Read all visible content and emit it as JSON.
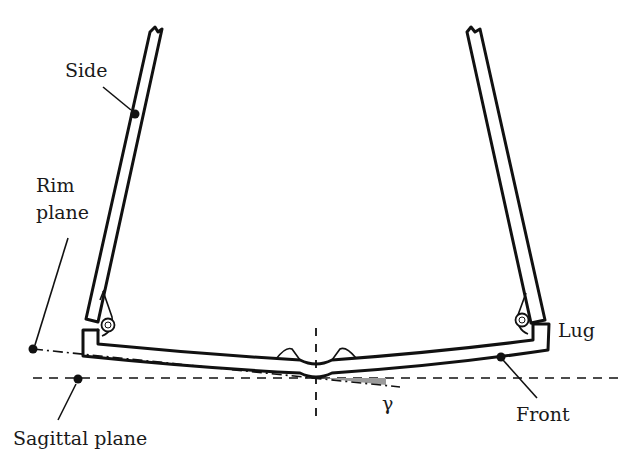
{
  "figure": {
    "labels": {
      "side": "Side",
      "rim_plane_line1": "Rim",
      "rim_plane_line2": "plane",
      "lug": "Lug",
      "front": "Front",
      "gamma": "γ",
      "sagittal_plane": "Sagittal plane"
    },
    "angle_symbol": "γ",
    "colors": {
      "ink": "#111111",
      "angle_shading": "#9a9a9a",
      "background": "#ffffff"
    }
  }
}
